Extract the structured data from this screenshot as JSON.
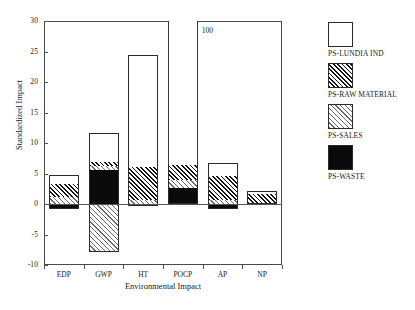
{
  "chart_data": {
    "type": "bar",
    "subtype": "stacked-bar-with-negatives",
    "title": "",
    "xlabel": "Environmental Impact",
    "ylabel": "Standardized Impact",
    "categories": [
      "EDP",
      "GWP",
      "HT",
      "POCP",
      "AP",
      "NP"
    ],
    "ylim": [
      -10,
      30
    ],
    "yticks": [
      -10,
      -5,
      0,
      5,
      10,
      15,
      20,
      25,
      30
    ],
    "ytick_labels": [
      "-10",
      "-5",
      "0",
      "5",
      "10",
      "15",
      "20",
      "25",
      "30"
    ],
    "grid": false,
    "legend_position": "right",
    "series": [
      {
        "name": "PS-LUNDIA IND",
        "fill": "white",
        "values": [
          1.5,
          4.8,
          18.5,
          93.6,
          2.2,
          0.5
        ]
      },
      {
        "name": "PS-RAW MATERIAL",
        "fill": "dark-hatch",
        "values": [
          2.1,
          0.6,
          5.4,
          2.4,
          4.0,
          1.6
        ]
      },
      {
        "name": "PS-SALES",
        "fill": "light-hatch",
        "values": [
          1.2,
          -7.0,
          0.6,
          1.3,
          -0.2,
          0.0
        ]
      },
      {
        "name": "PS-WASTE",
        "fill": "black",
        "values": [
          -0.8,
          5.5,
          -0.4,
          2.7,
          -0.6,
          0.0
        ]
      }
    ],
    "bar_totals": [
      4.8,
      11.7,
      24.5,
      100.0,
      6.8,
      2.1
    ],
    "negative_extents": [
      -0.8,
      -7.8,
      -0.4,
      0.0,
      -0.8,
      0.0
    ],
    "annotations": [
      {
        "text": "100",
        "category": "POCP",
        "note": "bar truncated at axis top; true value 100"
      }
    ],
    "stacks": [
      {
        "category": "EDP",
        "segments": [
          {
            "series": "PS-WASTE",
            "from": -0.8,
            "to": 0.0
          },
          {
            "series": "PS-SALES",
            "from": 0.0,
            "to": 1.2
          },
          {
            "series": "PS-RAW MATERIAL",
            "from": 1.2,
            "to": 3.3
          },
          {
            "series": "PS-LUNDIA IND",
            "from": 3.3,
            "to": 4.8
          }
        ]
      },
      {
        "category": "GWP",
        "segments": [
          {
            "series": "PS-SALES",
            "from": -7.8,
            "to": 0.0
          },
          {
            "series": "PS-WASTE",
            "from": 0.0,
            "to": 5.5
          },
          {
            "series": "PS-SALES",
            "from": 5.5,
            "to": 6.3
          },
          {
            "series": "PS-RAW MATERIAL",
            "from": 6.3,
            "to": 6.9
          },
          {
            "series": "PS-LUNDIA IND",
            "from": 6.9,
            "to": 11.7
          }
        ]
      },
      {
        "category": "HT",
        "segments": [
          {
            "series": "PS-WASTE",
            "from": -0.4,
            "to": 0.0
          },
          {
            "series": "PS-SALES",
            "from": 0.0,
            "to": 0.6
          },
          {
            "series": "PS-RAW MATERIAL",
            "from": 0.6,
            "to": 6.0
          },
          {
            "series": "PS-LUNDIA IND",
            "from": 6.0,
            "to": 24.5
          }
        ]
      },
      {
        "category": "POCP",
        "segments": [
          {
            "series": "PS-WASTE",
            "from": 0.0,
            "to": 2.7
          },
          {
            "series": "PS-SALES",
            "from": 2.7,
            "to": 4.0
          },
          {
            "series": "PS-RAW MATERIAL",
            "from": 4.0,
            "to": 6.4
          },
          {
            "series": "PS-LUNDIA IND",
            "from": 6.4,
            "to": 100.0
          }
        ]
      },
      {
        "category": "AP",
        "segments": [
          {
            "series": "PS-WASTE",
            "from": -0.8,
            "to": 0.0
          },
          {
            "series": "PS-SALES",
            "from": 0.0,
            "to": 0.6
          },
          {
            "series": "PS-RAW MATERIAL",
            "from": 0.6,
            "to": 4.6
          },
          {
            "series": "PS-LUNDIA IND",
            "from": 4.6,
            "to": 6.8
          }
        ]
      },
      {
        "category": "NP",
        "segments": [
          {
            "series": "PS-RAW MATERIAL",
            "from": 0.0,
            "to": 1.6
          },
          {
            "series": "PS-LUNDIA IND",
            "from": 1.6,
            "to": 2.1
          }
        ]
      }
    ]
  },
  "legend": {
    "items": [
      {
        "label": "PS-LUNDIA IND",
        "fill": "white"
      },
      {
        "label": "PS-RAW MATERIAL",
        "fill": "dark-hatch"
      },
      {
        "label": "PS-SALES",
        "fill": "light-hatch"
      },
      {
        "label": "PS-WASTE",
        "fill": "black"
      }
    ]
  },
  "colors": {
    "axis": "#555555",
    "bar_outline": "#2b2b2b",
    "white_fill": "#ffffff",
    "black_fill": "#0a0a0a",
    "text": "#1a1a1a"
  }
}
